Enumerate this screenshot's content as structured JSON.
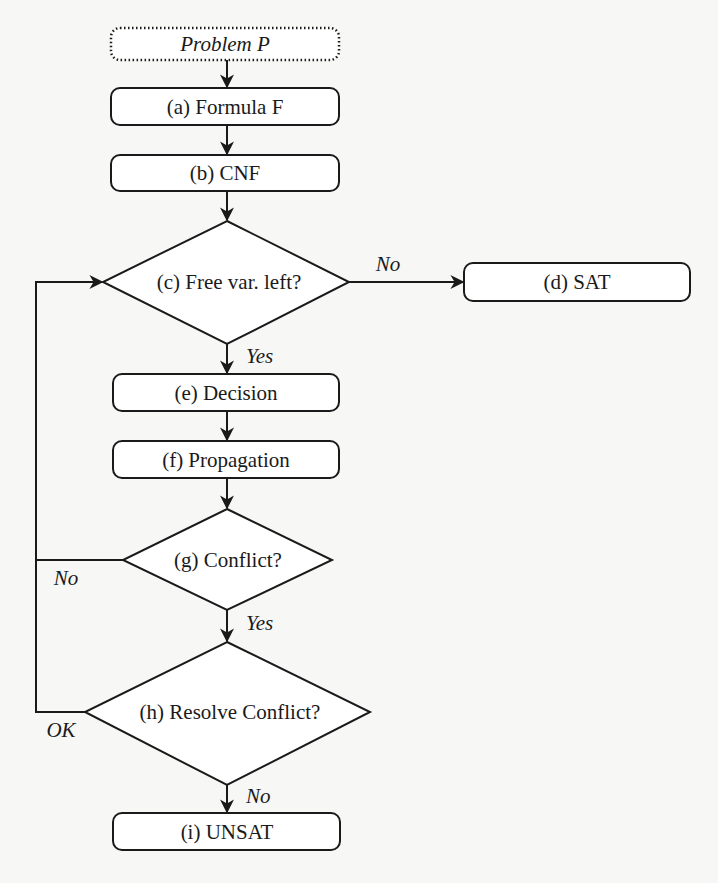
{
  "diagram": {
    "type": "flowchart",
    "nodes": {
      "start": {
        "id": "P",
        "label": "Problem P",
        "shape": "dotted-rounded-rect"
      },
      "a": {
        "id": "a",
        "label": "(a) Formula F",
        "shape": "rounded-rect"
      },
      "b": {
        "id": "b",
        "label": "(b) CNF",
        "shape": "rounded-rect"
      },
      "c": {
        "id": "c",
        "label": "(c) Free var. left?",
        "shape": "diamond"
      },
      "d": {
        "id": "d",
        "label": "(d) SAT",
        "shape": "rounded-rect"
      },
      "e": {
        "id": "e",
        "label": "(e) Decision",
        "shape": "rounded-rect"
      },
      "f": {
        "id": "f",
        "label": "(f) Propagation",
        "shape": "rounded-rect"
      },
      "g": {
        "id": "g",
        "label": "(g) Conflict?",
        "shape": "diamond"
      },
      "h": {
        "id": "h",
        "label": "(h) Resolve Conflict?",
        "shape": "diamond"
      },
      "i": {
        "id": "i",
        "label": "(i) UNSAT",
        "shape": "rounded-rect"
      }
    },
    "edge_labels": {
      "c_to_d": "No",
      "c_to_e": "Yes",
      "g_to_c": "No",
      "g_to_h": "Yes",
      "h_to_c": "OK",
      "h_to_i": "No"
    },
    "edges": [
      {
        "from": "P",
        "to": "a",
        "label": ""
      },
      {
        "from": "a",
        "to": "b",
        "label": ""
      },
      {
        "from": "b",
        "to": "c",
        "label": ""
      },
      {
        "from": "c",
        "to": "d",
        "label": "No"
      },
      {
        "from": "c",
        "to": "e",
        "label": "Yes"
      },
      {
        "from": "e",
        "to": "f",
        "label": ""
      },
      {
        "from": "f",
        "to": "g",
        "label": ""
      },
      {
        "from": "g",
        "to": "c",
        "label": "No"
      },
      {
        "from": "g",
        "to": "h",
        "label": "Yes"
      },
      {
        "from": "h",
        "to": "c",
        "label": "OK"
      },
      {
        "from": "h",
        "to": "i",
        "label": "No"
      }
    ]
  }
}
